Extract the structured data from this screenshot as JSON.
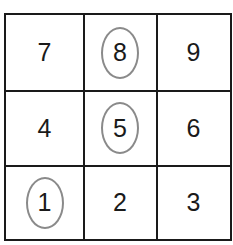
{
  "grid": {
    "rows": [
      [
        {
          "value": "7",
          "circled": false
        },
        {
          "value": "8",
          "circled": true
        },
        {
          "value": "9",
          "circled": false
        }
      ],
      [
        {
          "value": "4",
          "circled": false
        },
        {
          "value": "5",
          "circled": true
        },
        {
          "value": "6",
          "circled": false
        }
      ],
      [
        {
          "value": "1",
          "circled": true
        },
        {
          "value": "2",
          "circled": false
        },
        {
          "value": "3",
          "circled": false
        }
      ]
    ],
    "circle_color": "#8a8a8a",
    "line_color": "#1a1a1a"
  }
}
